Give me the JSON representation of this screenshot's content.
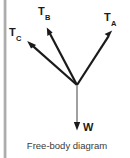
{
  "diagram": {
    "caption": "Free-body diagram",
    "background_color": "#ffffff",
    "line_color": "#1a1a1a",
    "edge_strip_color": "#a8a8a8",
    "junction": {
      "x": 77,
      "y": 85
    },
    "vectors": [
      {
        "id": "ta",
        "symbol": "T",
        "subscript": "A",
        "label": "TA",
        "direction": "upper-right",
        "from": {
          "x": 77,
          "y": 85
        },
        "to": {
          "x": 112,
          "y": 31
        },
        "label_pos": {
          "x": 104,
          "y": 12
        }
      },
      {
        "id": "tb",
        "symbol": "T",
        "subscript": "B",
        "label": "TB",
        "direction": "upper-left",
        "from": {
          "x": 77,
          "y": 85
        },
        "to": {
          "x": 47,
          "y": 28
        },
        "label_pos": {
          "x": 38,
          "y": 6
        }
      },
      {
        "id": "tc",
        "symbol": "T",
        "subscript": "C",
        "label": "TC",
        "direction": "upper-left-shallow",
        "from": {
          "x": 77,
          "y": 85
        },
        "to": {
          "x": 27,
          "y": 41
        },
        "label_pos": {
          "x": 9,
          "y": 27
        }
      },
      {
        "id": "w",
        "symbol": "W",
        "subscript": "",
        "label": "W",
        "direction": "down",
        "from": {
          "x": 77,
          "y": 85
        },
        "to": {
          "x": 77,
          "y": 130
        },
        "label_pos": {
          "x": 83,
          "y": 122
        }
      }
    ]
  }
}
